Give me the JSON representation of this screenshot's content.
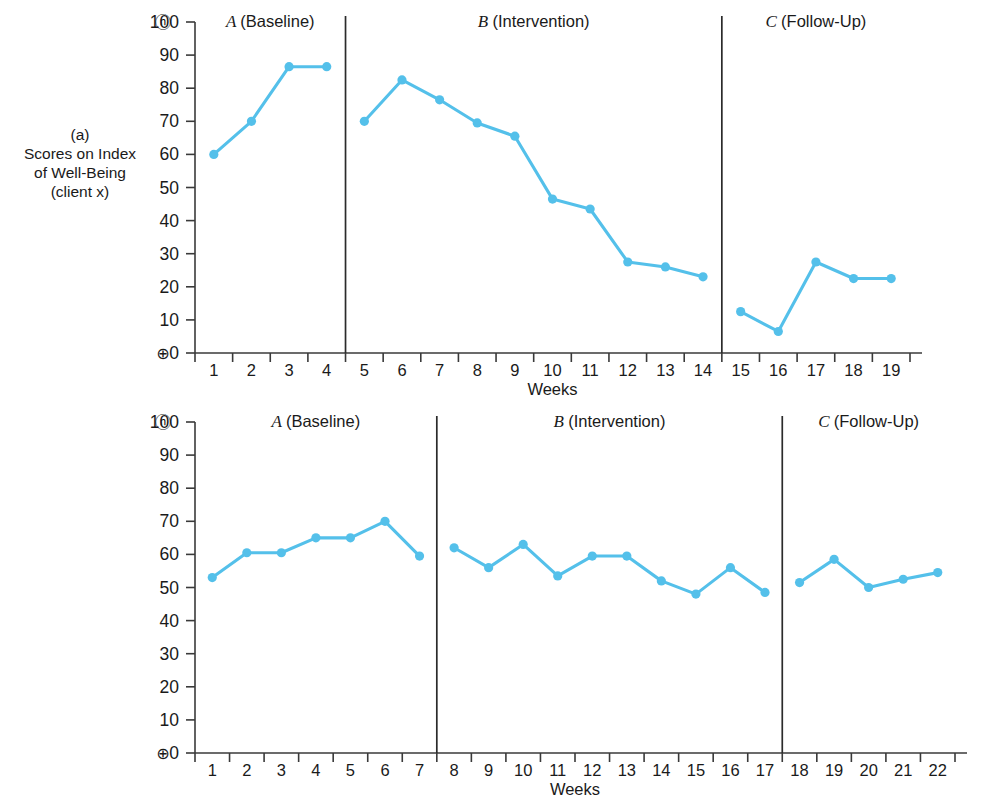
{
  "figure": {
    "background": "#ffffff",
    "series_color": "#54c0ea",
    "axis_color": "#3a3a3a",
    "panels": [
      "a",
      "b"
    ]
  },
  "panel_a": {
    "axis_title": "(a)\nScores on Index\nof Well-Being\n(client x)",
    "xlabel": "Weeks",
    "ceiling_marker": "ⓝ",
    "floor_marker": "⊕",
    "phases": [
      {
        "letter": "A",
        "name": "(Baseline)"
      },
      {
        "letter": "B",
        "name": "(Intervention)"
      },
      {
        "letter": "C",
        "name": "(Follow-Up)"
      }
    ]
  },
  "panel_b": {
    "axis_title": "(b)\nScores on Index\nof Well-Being\n(client y)",
    "xlabel": "Weeks",
    "ceiling_marker": "ⓝ",
    "floor_marker": "⊕",
    "phases": [
      {
        "letter": "A",
        "name": "(Baseline)"
      },
      {
        "letter": "B",
        "name": "(Intervention)"
      },
      {
        "letter": "C",
        "name": "(Follow-Up)"
      }
    ]
  },
  "caption": "",
  "chart_data": [
    {
      "type": "line",
      "id": "panel-a",
      "title": "(a) Scores on Index of Well-Being (client x)",
      "xlabel": "Weeks",
      "ylabel": "Scores on Index of Well-Being (client x)",
      "xlim": [
        0.5,
        19.5
      ],
      "ylim": [
        0,
        100
      ],
      "yticks": [
        0,
        10,
        20,
        30,
        40,
        50,
        60,
        70,
        80,
        90,
        100
      ],
      "xticks": [
        1,
        2,
        3,
        4,
        5,
        6,
        7,
        8,
        9,
        10,
        11,
        12,
        13,
        14,
        15,
        16,
        17,
        18,
        19
      ],
      "grid": false,
      "legend": "none",
      "phase_dividers_at_x": [
        4.5,
        14.5
      ],
      "annotations": [
        {
          "text": "A (Baseline)",
          "phase": "A",
          "x_range": [
            1,
            4
          ]
        },
        {
          "text": "B (Intervention)",
          "phase": "B",
          "x_range": [
            5,
            14
          ]
        },
        {
          "text": "C (Follow-Up)",
          "phase": "C",
          "x_range": [
            15,
            19
          ]
        }
      ],
      "segments": [
        {
          "phase": "A",
          "x": [
            1,
            2,
            3,
            4
          ],
          "values": [
            60,
            70,
            86.5,
            86.5
          ]
        },
        {
          "phase": "B",
          "x": [
            5,
            6,
            7,
            8,
            9,
            10,
            11,
            12,
            13,
            14
          ],
          "values": [
            70,
            82.5,
            76.5,
            69.5,
            65.5,
            46.5,
            43.5,
            27.5,
            26,
            23
          ]
        },
        {
          "phase": "C",
          "x": [
            15,
            16,
            17,
            18,
            19
          ],
          "values": [
            12.5,
            6.5,
            27.5,
            22.5,
            22.5
          ]
        }
      ],
      "x": [
        1,
        2,
        3,
        4,
        5,
        6,
        7,
        8,
        9,
        10,
        11,
        12,
        13,
        14,
        15,
        16,
        17,
        18,
        19
      ],
      "values": [
        60,
        70,
        86.5,
        86.5,
        70,
        82.5,
        76.5,
        69.5,
        65.5,
        46.5,
        43.5,
        27.5,
        26,
        23,
        12.5,
        6.5,
        27.5,
        22.5,
        22.5
      ]
    },
    {
      "type": "line",
      "id": "panel-b",
      "title": "(b) Scores on Index of Well-Being (client y)",
      "xlabel": "Weeks",
      "ylabel": "Scores on Index of Well-Being (client y)",
      "xlim": [
        0.5,
        22.5
      ],
      "ylim": [
        0,
        100
      ],
      "yticks": [
        0,
        10,
        20,
        30,
        40,
        50,
        60,
        70,
        80,
        90,
        100
      ],
      "xticks": [
        1,
        2,
        3,
        4,
        5,
        6,
        7,
        8,
        9,
        10,
        11,
        12,
        13,
        14,
        15,
        16,
        17,
        18,
        19,
        20,
        21,
        22
      ],
      "grid": false,
      "legend": "none",
      "phase_dividers_at_x": [
        7.5,
        17.5
      ],
      "annotations": [
        {
          "text": "A (Baseline)",
          "phase": "A",
          "x_range": [
            1,
            7
          ]
        },
        {
          "text": "B (Intervention)",
          "phase": "B",
          "x_range": [
            8,
            17
          ]
        },
        {
          "text": "C (Follow-Up)",
          "phase": "C",
          "x_range": [
            18,
            22
          ]
        }
      ],
      "segments": [
        {
          "phase": "A",
          "x": [
            1,
            2,
            3,
            4,
            5,
            6,
            7
          ],
          "values": [
            53,
            60.5,
            60.5,
            65,
            65,
            70,
            59.5
          ]
        },
        {
          "phase": "B",
          "x": [
            8,
            9,
            10,
            11,
            12,
            13,
            14,
            15,
            16,
            17
          ],
          "values": [
            62,
            56,
            63,
            53.5,
            59.5,
            59.5,
            52,
            48,
            56,
            48.5
          ]
        },
        {
          "phase": "C",
          "x": [
            18,
            19,
            20,
            21,
            22
          ],
          "values": [
            51.5,
            58.5,
            50,
            52.5,
            54.5
          ]
        }
      ],
      "x": [
        1,
        2,
        3,
        4,
        5,
        6,
        7,
        8,
        9,
        10,
        11,
        12,
        13,
        14,
        15,
        16,
        17,
        18,
        19,
        20,
        21,
        22
      ],
      "values": [
        53,
        60.5,
        60.5,
        65,
        65,
        70,
        59.5,
        62,
        56,
        63,
        53.5,
        59.5,
        59.5,
        52,
        48,
        56,
        48.5,
        51.5,
        58.5,
        50,
        52.5,
        54.5
      ]
    }
  ]
}
